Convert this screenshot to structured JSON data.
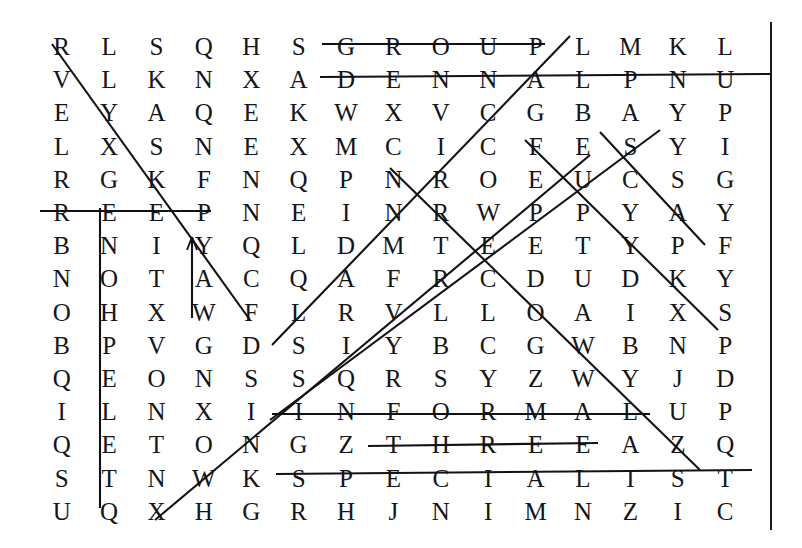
{
  "puzzle": {
    "type": "word-search",
    "title": "Word Search Grid",
    "rows": 15,
    "columns": 15,
    "ink_color": "#15151a",
    "background_color": "#ffffff",
    "grid": [
      [
        "R",
        "L",
        "S",
        "Q",
        "H",
        "S",
        "G",
        "R",
        "O",
        "U",
        "P",
        "L",
        "M",
        "K",
        "L"
      ],
      [
        "V",
        "L",
        "K",
        "N",
        "X",
        "A",
        "D",
        "E",
        "N",
        "N",
        "A",
        "L",
        "P",
        "N",
        "U"
      ],
      [
        "E",
        "Y",
        "A",
        "Q",
        "E",
        "K",
        "W",
        "X",
        "V",
        "C",
        "G",
        "B",
        "A",
        "Y",
        "P"
      ],
      [
        "L",
        "X",
        "S",
        "N",
        "E",
        "X",
        "M",
        "C",
        "I",
        "C",
        "F",
        "E",
        "S",
        "Y",
        "I"
      ],
      [
        "R",
        "G",
        "K",
        "F",
        "N",
        "Q",
        "P",
        "N",
        "R",
        "O",
        "E",
        "U",
        "C",
        "S",
        "G"
      ],
      [
        "R",
        "E",
        "E",
        "P",
        "N",
        "E",
        "I",
        "N",
        "R",
        "W",
        "P",
        "P",
        "Y",
        "A",
        "Y"
      ],
      [
        "B",
        "N",
        "I",
        "Y",
        "Q",
        "L",
        "D",
        "M",
        "T",
        "E",
        "E",
        "T",
        "Y",
        "P",
        "F"
      ],
      [
        "N",
        "O",
        "T",
        "A",
        "C",
        "Q",
        "A",
        "F",
        "R",
        "C",
        "D",
        "U",
        "D",
        "K",
        "Y"
      ],
      [
        "O",
        "H",
        "X",
        "W",
        "F",
        "L",
        "R",
        "V",
        "L",
        "L",
        "O",
        "A",
        "I",
        "X",
        "S"
      ],
      [
        "B",
        "P",
        "V",
        "G",
        "D",
        "S",
        "I",
        "Y",
        "B",
        "C",
        "G",
        "W",
        "B",
        "N",
        "P"
      ],
      [
        "Q",
        "E",
        "O",
        "N",
        "S",
        "S",
        "Q",
        "R",
        "S",
        "Y",
        "Z",
        "W",
        "Y",
        "J",
        "D"
      ],
      [
        "I",
        "L",
        "N",
        "X",
        "I",
        "I",
        "N",
        "F",
        "O",
        "R",
        "M",
        "A",
        "L",
        "U",
        "P"
      ],
      [
        "Q",
        "E",
        "T",
        "O",
        "N",
        "G",
        "Z",
        "T",
        "H",
        "R",
        "E",
        "E",
        "A",
        "Z",
        "Q"
      ],
      [
        "S",
        "T",
        "N",
        "W",
        "K",
        "S",
        "P",
        "E",
        "C",
        "I",
        "A",
        "L",
        "I",
        "S",
        "T"
      ],
      [
        "U",
        "Q",
        "X",
        "H",
        "G",
        "R",
        "H",
        "J",
        "N",
        "I",
        "M",
        "N",
        "Z",
        "I",
        "C"
      ]
    ],
    "found_words": [
      {
        "word": "GROUP",
        "direction": "horizontal",
        "row": 1,
        "start_col": 7,
        "end_col": 11
      },
      {
        "word": "PLANNED",
        "direction": "horizontal-reversed",
        "row": 2,
        "start_col": 7,
        "end_col": 15
      },
      {
        "word": "PEER",
        "direction": "horizontal-reversed",
        "row": 6,
        "start_col": 1,
        "end_col": 4
      },
      {
        "word": "INFORMAL",
        "direction": "horizontal",
        "row": 12,
        "start_col": 6,
        "end_col": 13
      },
      {
        "word": "THREE",
        "direction": "horizontal",
        "row": 13,
        "start_col": 8,
        "end_col": 12
      },
      {
        "word": "SPECIALIST",
        "direction": "horizontal",
        "row": 14,
        "start_col": 6,
        "end_col": 15
      },
      {
        "word": "TELEPHONE",
        "direction": "vertical-reversed",
        "column": 2,
        "start_row": 15,
        "end_row": 6
      },
      {
        "word": "YAW",
        "direction": "vertical-reversed",
        "column": 4,
        "start_row": 9,
        "end_row": 7
      },
      {
        "word": "DIAGONAL-1",
        "direction": "diagonal-down-right",
        "start_row": 1,
        "start_col": 1,
        "end_row": 9,
        "end_col": 5
      },
      {
        "word": "DIAGONAL-2",
        "direction": "diagonal-down-left",
        "start_row": 1,
        "start_col": 12,
        "end_row": 9,
        "end_col": 6
      },
      {
        "word": "DIAGONAL-3",
        "direction": "diagonal-up-right",
        "start_row": 15,
        "start_col": 3,
        "end_row": 6,
        "end_col": 12
      },
      {
        "word": "DIAGONAL-4",
        "direction": "diagonal-up-right",
        "start_row": 12,
        "start_col": 6,
        "end_row": 4,
        "end_col": 13
      },
      {
        "word": "DIAGONAL-5",
        "direction": "diagonal-down-right",
        "start_row": 4,
        "start_col": 11,
        "end_row": 9,
        "end_col": 15
      },
      {
        "word": "DIAGONAL-6",
        "direction": "diagonal-down-right",
        "start_row": 5,
        "start_col": 8,
        "end_row": 11,
        "end_col": 14
      },
      {
        "word": "DIAGONAL-7",
        "direction": "diagonal-down-right",
        "start_row": 4,
        "start_col": 13,
        "end_row": 7,
        "end_col": 15
      }
    ]
  }
}
